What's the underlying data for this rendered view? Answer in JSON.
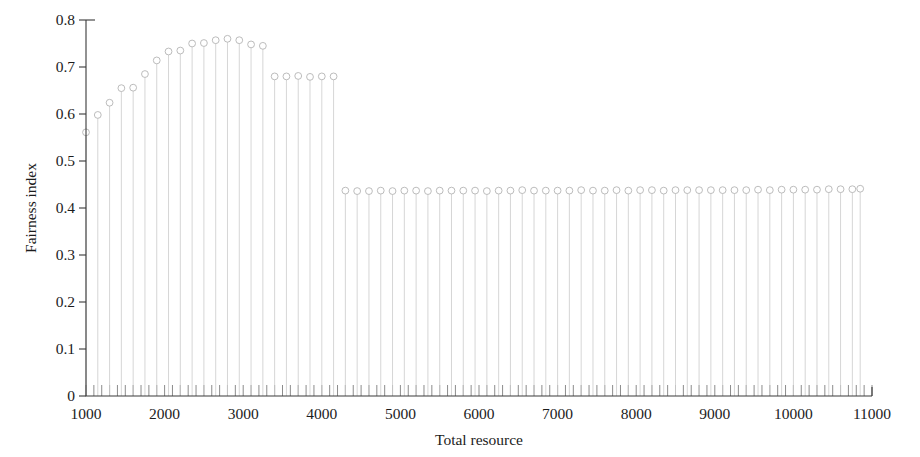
{
  "chart_data": {
    "type": "line",
    "plot_style": "stem",
    "title": "",
    "subtitle": "",
    "xlabel": "Total resource",
    "ylabel": "Fairness index",
    "xlim": [
      1000,
      11000
    ],
    "ylim": [
      0,
      0.8
    ],
    "xticks": [
      1000,
      2000,
      3000,
      4000,
      5000,
      6000,
      7000,
      8000,
      9000,
      10000,
      11000
    ],
    "xtick_labels": [
      "1000",
      "2000",
      "3000",
      "4000",
      "5000",
      "6000",
      "7000",
      "8000",
      "9000",
      "10000",
      "11000"
    ],
    "yticks": [
      0,
      0.1,
      0.2,
      0.3,
      0.4,
      0.5,
      0.6,
      0.7,
      0.8
    ],
    "ytick_labels": [
      "0",
      "0.1",
      "0.2",
      "0.3",
      "0.4",
      "0.5",
      "0.6",
      "0.7",
      "0.8"
    ],
    "x_minor_tick_step": 100,
    "grid": false,
    "legend": null,
    "legend_position": "none",
    "marker": "open-circle",
    "marker_color": "#b4b4b4",
    "stem_color": "#cfcfcf",
    "axis_color": "#3a3a3a",
    "x": [
      1000,
      1150,
      1300,
      1450,
      1600,
      1750,
      1900,
      2050,
      2200,
      2350,
      2500,
      2650,
      2800,
      2950,
      3100,
      3250,
      3400,
      3550,
      3700,
      3850,
      4000,
      4150,
      4300,
      4450,
      4600,
      4750,
      4900,
      5050,
      5200,
      5350,
      5500,
      5650,
      5800,
      5950,
      6100,
      6250,
      6400,
      6550,
      6700,
      6850,
      7000,
      7150,
      7300,
      7450,
      7600,
      7750,
      7900,
      8050,
      8200,
      8350,
      8500,
      8650,
      8800,
      8950,
      9100,
      9250,
      9400,
      9550,
      9700,
      9850,
      10000,
      10150,
      10300,
      10450,
      10600,
      10750,
      10850
    ],
    "values": [
      0.561,
      0.598,
      0.624,
      0.655,
      0.656,
      0.685,
      0.714,
      0.733,
      0.735,
      0.75,
      0.751,
      0.757,
      0.76,
      0.757,
      0.748,
      0.745,
      0.68,
      0.68,
      0.681,
      0.679,
      0.68,
      0.68,
      0.437,
      0.436,
      0.436,
      0.437,
      0.436,
      0.437,
      0.437,
      0.436,
      0.437,
      0.437,
      0.437,
      0.437,
      0.436,
      0.437,
      0.437,
      0.438,
      0.437,
      0.437,
      0.437,
      0.437,
      0.438,
      0.437,
      0.437,
      0.438,
      0.437,
      0.438,
      0.438,
      0.437,
      0.438,
      0.438,
      0.438,
      0.438,
      0.438,
      0.438,
      0.438,
      0.439,
      0.438,
      0.439,
      0.439,
      0.439,
      0.439,
      0.44,
      0.44,
      0.44,
      0.441
    ]
  }
}
